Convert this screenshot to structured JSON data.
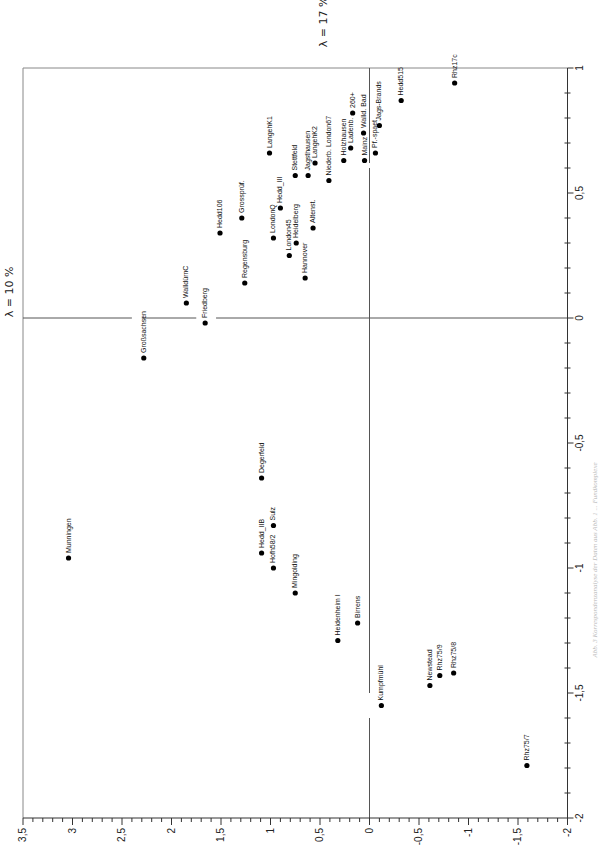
{
  "chart_data": {
    "type": "scatter",
    "title": "",
    "orientation_note": "figure printed rotated 90°: dimension 1 runs along bottom axis (3.5 left to -2 right), dimension 2 along right axis (1 top to -2 bottom)",
    "xlabel": "λ = 10 %",
    "ylabel": "λ = 17 %",
    "xlim": [
      3.5,
      -2
    ],
    "ylim": [
      -2,
      1
    ],
    "x_ticks": [
      "3,5",
      "3",
      "2,5",
      "2",
      "1,5",
      "1",
      "0,5",
      "0",
      "-0,5",
      "-1",
      "-1,5",
      "-2"
    ],
    "y_ticks": [
      "1",
      "0,5",
      "0",
      "-0,5",
      "-1",
      "-1,5",
      "-2"
    ],
    "grid": false,
    "legend": null,
    "caption": "Abb. 3 Korrespondenzanalyse der Daten aus Abb. 1 ... Fundkomplexe",
    "points": [
      {
        "label": "Rhz17c",
        "x": -0.86,
        "y": 0.94
      },
      {
        "label": "Hedd515",
        "x": -0.32,
        "y": 0.87
      },
      {
        "label": "Jags-Brands",
        "x": -0.1,
        "y": 0.77
      },
      {
        "label": "Pf.-spaet",
        "x": -0.06,
        "y": 0.66
      },
      {
        "label": "Walld. Bad",
        "x": 0.06,
        "y": 0.74
      },
      {
        "label": "260+",
        "x": 0.17,
        "y": 0.82
      },
      {
        "label": "Ladenb.",
        "x": 0.19,
        "y": 0.68
      },
      {
        "label": "Mainz",
        "x": 0.05,
        "y": 0.63
      },
      {
        "label": "Holzhausen",
        "x": 0.26,
        "y": 0.63
      },
      {
        "label": "LangehK1",
        "x": 1.01,
        "y": 0.66
      },
      {
        "label": "LangehK2",
        "x": 0.55,
        "y": 0.62
      },
      {
        "label": "Jagsthausen",
        "x": 0.62,
        "y": 0.57
      },
      {
        "label": "Stettfeld",
        "x": 0.75,
        "y": 0.57
      },
      {
        "label": "Niederb. London67",
        "x": 0.41,
        "y": 0.55
      },
      {
        "label": "Hedd_III",
        "x": 0.9,
        "y": 0.44
      },
      {
        "label": "Altenst.",
        "x": 0.57,
        "y": 0.36
      },
      {
        "label": "Hedd106",
        "x": 1.51,
        "y": 0.34
      },
      {
        "label": "Grossprüf.",
        "x": 1.29,
        "y": 0.4
      },
      {
        "label": "LondonQ",
        "x": 0.97,
        "y": 0.32
      },
      {
        "label": "Heidelberg",
        "x": 0.74,
        "y": 0.3
      },
      {
        "label": "London45",
        "x": 0.81,
        "y": 0.25
      },
      {
        "label": "Hannover",
        "x": 0.65,
        "y": 0.16
      },
      {
        "label": "Regensburg",
        "x": 1.26,
        "y": 0.14
      },
      {
        "label": "WalldürnC",
        "x": 1.85,
        "y": 0.06
      },
      {
        "label": "Friedberg",
        "x": 1.66,
        "y": -0.02
      },
      {
        "label": "Großsachsen",
        "x": 2.28,
        "y": -0.16
      },
      {
        "label": "Degerfeld",
        "x": 1.09,
        "y": -0.64
      },
      {
        "label": "Sulz",
        "x": 0.97,
        "y": -0.83
      },
      {
        "label": "Hedd_IIB",
        "x": 1.09,
        "y": -0.94
      },
      {
        "label": "Hofh58/2",
        "x": 0.97,
        "y": -1.0
      },
      {
        "label": "Mingolding",
        "x": 0.75,
        "y": -1.1
      },
      {
        "label": "Munningen",
        "x": 3.04,
        "y": -0.96
      },
      {
        "label": "Heidenheim I",
        "x": 0.32,
        "y": -1.29
      },
      {
        "label": "Birrens",
        "x": 0.12,
        "y": -1.22
      },
      {
        "label": "Kumpfmühl",
        "x": -0.12,
        "y": -1.55
      },
      {
        "label": "Newstead",
        "x": -0.61,
        "y": -1.47
      },
      {
        "label": "Rhz75/9",
        "x": -0.71,
        "y": -1.43
      },
      {
        "label": "Rhz75/8",
        "x": -0.85,
        "y": -1.42
      },
      {
        "label": "Rhz75/7",
        "x": -1.59,
        "y": -1.79
      }
    ]
  },
  "layout": {
    "x_axis": {
      "value_at_left": 3.5,
      "px_left": 23,
      "px_per_unit": 99
    },
    "y_axis": {
      "value_at_top": 1,
      "px_top": 68,
      "px_per_unit": 250
    },
    "colors": {
      "axis": "#555555",
      "frame": "#888888",
      "point": "#000000"
    }
  }
}
